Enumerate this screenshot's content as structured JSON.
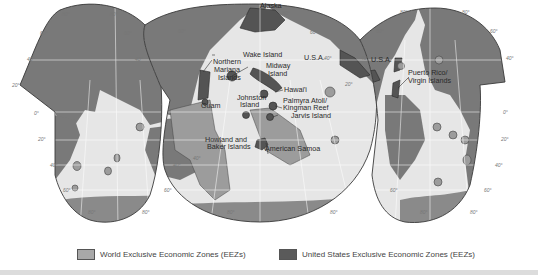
{
  "map": {
    "title": "World and United States Exclusive Economic Zones",
    "labels": {
      "alaska": "Alaska",
      "wake": "Wake Island",
      "usa_left": "U.S.A.",
      "usa_right": "U.S.A.",
      "nmariana_1": "Northern",
      "nmariana_2": "Mariana",
      "nmariana_3": "Islands",
      "midway_1": "Midway",
      "midway_2": "Island",
      "hawaii": "Hawai'i",
      "guam": "Guam",
      "johnston_1": "Johnston",
      "johnston_2": "Island",
      "palmyra_1": "Palmyra Atoll/",
      "palmyra_2": "Kingman Reef",
      "jarvis": "Jarvis Island",
      "howland_1": "Howland and",
      "howland_2": "Baker Islands",
      "samoa": "American Samoa",
      "puerto_1": "Puerto Rico/",
      "puerto_2": "Virgin Islands"
    },
    "degree_ticks": [
      "80°",
      "60°",
      "40°",
      "20°",
      "0°",
      "20°",
      "40°",
      "60°",
      "80°"
    ],
    "colors": {
      "land": "#7a7a7a",
      "ocean": "#e6e6e6",
      "world_eez": "#9c9c9c",
      "us_eez": "#555555",
      "outline": "#3a3a3a"
    }
  },
  "legend": {
    "items": [
      {
        "label": "World Exclusive Economic Zones (EEZs)",
        "color": "#a8a8a8"
      },
      {
        "label": "United States Exclusive Economic Zones (EEZs)",
        "color": "#5a5a5a"
      }
    ]
  }
}
